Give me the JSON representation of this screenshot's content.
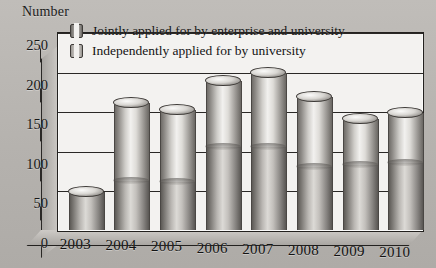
{
  "figure": {
    "y_axis_caption": "Number",
    "background_color": "#b5b2ae",
    "plot_bg_color": "#f3f2f0"
  },
  "legend": {
    "position": "top-left-inside",
    "items": [
      {
        "label": "Jointly applied for by enterprise and university",
        "swatch": "cylinder-swatch-dark",
        "color": "#6e6b67"
      },
      {
        "label": "Independently applied for by university",
        "swatch": "cylinder-swatch-light",
        "color": "#c2bfbb"
      }
    ]
  },
  "chart_data": {
    "type": "bar",
    "title": "",
    "subtitle": "",
    "xlabel": "",
    "ylabel": "Number",
    "categories": [
      "2003",
      "2004",
      "2005",
      "2006",
      "2007",
      "2008",
      "2009",
      "2010"
    ],
    "values": [
      48,
      160,
      152,
      188,
      198,
      168,
      140,
      148
    ],
    "series": [
      {
        "name": "Jointly applied for by enterprise and university",
        "values": [
          48,
          62,
          60,
          105,
          105,
          80,
          82,
          84
        ]
      },
      {
        "name": "Independently applied for by university",
        "values": [
          0,
          98,
          92,
          83,
          93,
          88,
          58,
          64
        ]
      }
    ],
    "ylim": [
      0,
      250
    ],
    "yticks": [
      0,
      50,
      100,
      150,
      200,
      250
    ],
    "grid": true,
    "style": "3d-stacked-cylinder",
    "legend_position": "upper-left"
  },
  "caption": ""
}
